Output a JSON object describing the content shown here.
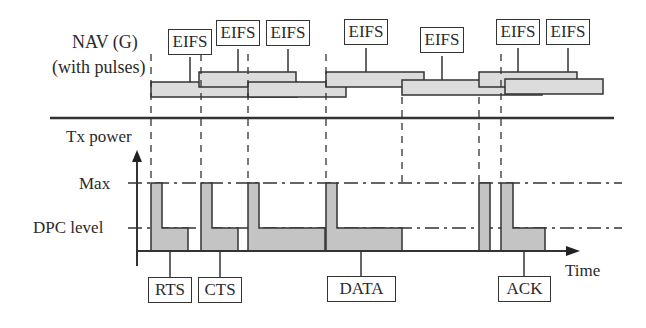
{
  "nav": {
    "title_line1": "NAV (G)",
    "title_line2": "(with pulses)",
    "eifs_labels": [
      "EIFS",
      "EIFS",
      "EIFS",
      "EIFS",
      "EIFS",
      "EIFS",
      "EIFS"
    ]
  },
  "axis": {
    "y_label": "Tx power",
    "x_label": "Time",
    "levels": [
      "Max",
      "DPC level"
    ]
  },
  "frames": [
    "RTS",
    "CTS",
    "DATA",
    "ACK"
  ],
  "colors": {
    "fill": "#c8c8c8",
    "nav_fill": "#dcdcdc",
    "line": "#333333"
  }
}
